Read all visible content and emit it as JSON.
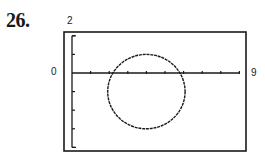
{
  "problem": {
    "number": "26."
  },
  "labels": {
    "ymax": "2",
    "xmin": "0",
    "xmax": "9"
  },
  "chart_data": {
    "type": "line",
    "title": "",
    "xlabel": "",
    "ylabel": "",
    "xlim": [
      0,
      9
    ],
    "ylim": [
      -4,
      2
    ],
    "x_ticks": [
      0,
      1,
      2,
      3,
      4,
      5,
      6,
      7,
      8,
      9
    ],
    "y_ticks": [
      -4,
      -3,
      -2,
      -1,
      0,
      1,
      2
    ],
    "tick_labels": {
      "x_min": "0",
      "x_max": "9",
      "y_max": "2"
    },
    "grid": false,
    "series": [
      {
        "name": "circle",
        "shape": "circle",
        "center": [
          4,
          -1
        ],
        "radius": 2,
        "style": "dotted"
      }
    ],
    "colors": {
      "ink": "#1a1a1a",
      "background": "#ffffff"
    }
  }
}
